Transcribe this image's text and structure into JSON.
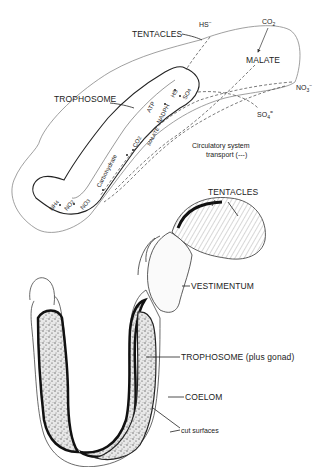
{
  "figure": {
    "top_diagram": {
      "labels": {
        "tentacles": "TENTACLES",
        "hs_top": "HS",
        "hs_top_sup": "−",
        "co2": "CO",
        "co2_sub": "2",
        "malate": "MALATE",
        "no3_right": "NO",
        "no3_right_sub": "3",
        "no3_right_sup": "−",
        "so4_right": "SO",
        "so4_right_sub": "4",
        "so4_right_sup": "=",
        "trophosome": "TROPHOSOME",
        "atp": "ATP",
        "nadph": "NADPH",
        "hs_inner": "HS",
        "so4_inner": "SO",
        "so4_inner_sub": "4",
        "carbohydrate": "Carbohydrate",
        "co2_inner": "CO",
        "co2_inner_sub": "2",
        "malate_inner": "MALATE",
        "nh4": "NH",
        "nh4_sub": "4",
        "no2": "NO",
        "no2_sub": "2",
        "no3_inner": "NO",
        "no3_inner_sub": "3",
        "circulatory_line1": "Circulatory system",
        "circulatory_line2": "transport (---)"
      }
    },
    "bottom_drawing": {
      "labels": {
        "tentacles": "TENTACLES",
        "vestimentum": "VESTIMENTUM",
        "trophosome_gonad": "TROPHOSOME (plus gonad)",
        "coelom": "COELOM",
        "cut_surfaces": "cut surfaces"
      }
    }
  }
}
